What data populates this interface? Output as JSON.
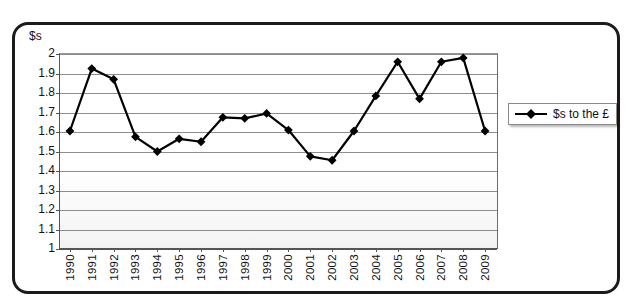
{
  "chart_data": {
    "type": "line",
    "title": "",
    "xlabel": "",
    "ylabel": "$s",
    "ylim": [
      1,
      2
    ],
    "ytick_step": 0.1,
    "grid": true,
    "legend_position": "right",
    "marker": "diamond",
    "series_color": "#000000",
    "categories": [
      "1990",
      "1991",
      "1992",
      "1993",
      "1994",
      "1995",
      "1996",
      "1997",
      "1998",
      "1999",
      "2000",
      "2001",
      "2002",
      "2003",
      "2004",
      "2005",
      "2006",
      "2007",
      "2008",
      "2009"
    ],
    "series": [
      {
        "name": "$s to the £",
        "values": [
          1.6,
          1.92,
          1.865,
          1.57,
          1.495,
          1.56,
          1.545,
          1.67,
          1.665,
          1.69,
          1.605,
          1.47,
          1.45,
          1.6,
          1.78,
          1.955,
          1.765,
          1.955,
          1.975,
          1.6
        ]
      }
    ],
    "ytick_labels": [
      "2",
      "1.9",
      "1.8",
      "1.7",
      "1.6",
      "1.5",
      "1.4",
      "1.3",
      "1.2",
      "1.1",
      "1"
    ],
    "xtick_labels": [
      "1990",
      "1991",
      "1992",
      "1993",
      "1994",
      "1995",
      "1996",
      "1997",
      "1998",
      "1999",
      "2000",
      "2001",
      "2002",
      "2003",
      "2004",
      "2005",
      "2006",
      "2007",
      "2008",
      "2009"
    ]
  },
  "axis": {
    "y_title": "$s"
  },
  "legend": {
    "entries": [
      {
        "label": "$s to the £",
        "marker": "diamond-marker",
        "color": "#000000"
      }
    ]
  }
}
